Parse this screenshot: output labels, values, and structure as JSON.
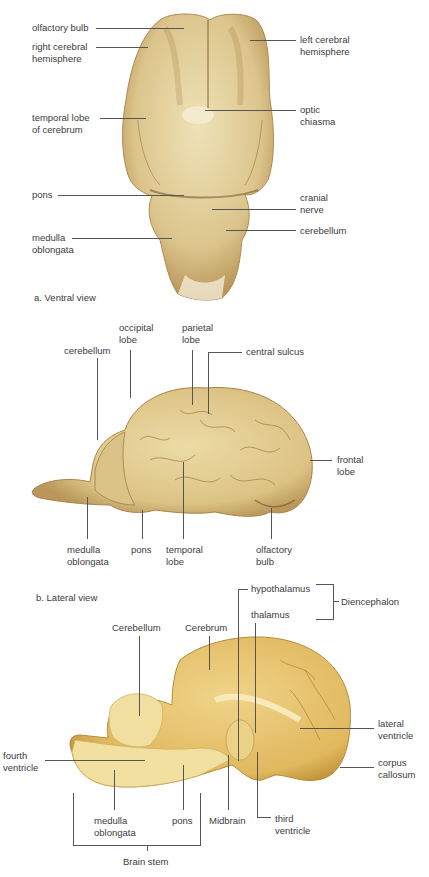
{
  "figure": {
    "panel_a": {
      "caption": "a. Ventral view",
      "labels": {
        "olfactory_bulb": "olfactory bulb",
        "right_cerebral_hemisphere": "right cerebral\nhemisphere",
        "temporal_lobe": "temporal lobe\nof cerebrum",
        "pons": "pons",
        "medulla_oblongata": "medulla\noblongata",
        "left_cerebral_hemisphere": "left cerebral\nhemisphere",
        "optic_chiasma": "optic\nchiasma",
        "cranial_nerve": "cranial\nnerve",
        "cerebellum": "cerebellum"
      }
    },
    "panel_b": {
      "caption": "b. Lateral view",
      "labels": {
        "cerebellum": "cerebellum",
        "occipital_lobe": "occipital\nlobe",
        "parietal_lobe": "parietal\nlobe",
        "central_sulcus": "central sulcus",
        "frontal_lobe": "frontal\nlobe",
        "medulla_oblongata": "medulla\noblongata",
        "pons": "pons",
        "temporal_lobe": "temporal\nlobe",
        "olfactory_bulb": "olfactory\nbulb"
      }
    },
    "panel_c": {
      "labels": {
        "hypothalamus": "hypothalamus",
        "thalamus": "thalamus",
        "diencephalon": "Diencephalon",
        "cerebellum": "Cerebellum",
        "cerebrum": "Cerebrum",
        "lateral_ventricle": "lateral\nventricle",
        "corpus_callosum": "corpus\ncallosum",
        "fourth_ventricle": "fourth\nventricle",
        "medulla_oblongata": "medulla\noblongata",
        "pons": "pons",
        "midbrain": "Midbrain",
        "third_ventricle": "third\nventricle",
        "brain_stem": "Brain stem"
      }
    },
    "colors": {
      "tissue_light": "#e9d9a6",
      "tissue_mid": "#d8c184",
      "tissue_dark": "#a8844a",
      "sagittal": "#e8c66a",
      "sagittal_light": "#f1dc96",
      "leader_line": "#555555",
      "label_text": "#3b3b3b"
    }
  }
}
